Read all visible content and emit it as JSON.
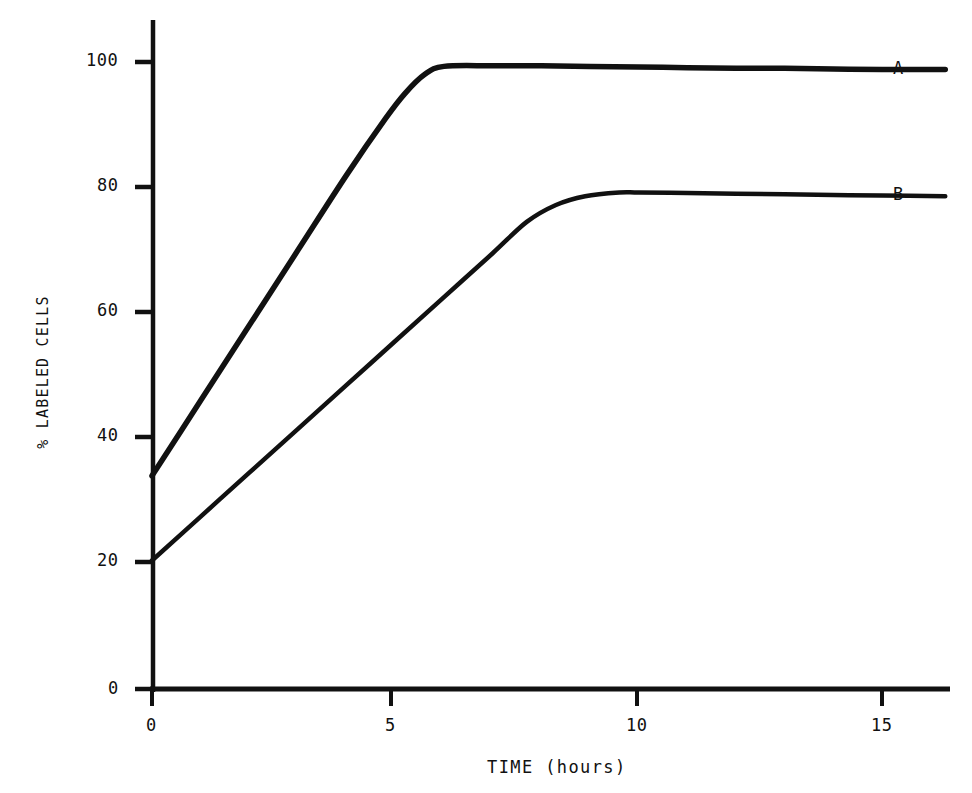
{
  "chart_data": {
    "type": "line",
    "title": "",
    "subtitle": "",
    "xlabel": "TIME (hours)",
    "ylabel": "% LABELED CELLS",
    "xlim": [
      0,
      16.3
    ],
    "ylim": [
      0,
      110
    ],
    "xticks": [
      0,
      5,
      10,
      15
    ],
    "xtick_labels": [
      "0",
      "5",
      "10",
      "15"
    ],
    "yticks": [
      0,
      20,
      40,
      60,
      80,
      100
    ],
    "ytick_labels": [
      "0",
      "20",
      "40",
      "60",
      "80",
      "100"
    ],
    "grid": false,
    "legend": "inline-right-end-labels",
    "line_color": "#111111",
    "background_color": "#ffffff",
    "series": [
      {
        "name": "A",
        "label": "A",
        "end_label": "A",
        "x": [
          0,
          1,
          2,
          3,
          4,
          4.8,
          5.2,
          5.6,
          6.0,
          7,
          8,
          9,
          10,
          11,
          12,
          13,
          14,
          15,
          16.3
        ],
        "values": [
          34,
          46,
          58,
          70,
          82,
          91,
          95,
          98,
          99.3,
          99.4,
          99.4,
          99.3,
          99.2,
          99.1,
          99.0,
          99.0,
          98.9,
          98.8,
          98.8
        ]
      },
      {
        "name": "B",
        "label": "B",
        "end_label": "B",
        "x": [
          0,
          1,
          2,
          3,
          4,
          5,
          6,
          7,
          7.7,
          8.3,
          8.9,
          9.6,
          10,
          11,
          12,
          13,
          14,
          15,
          16.3
        ],
        "values": [
          20.5,
          27.5,
          34.5,
          41.5,
          48.5,
          55.5,
          62.5,
          69.5,
          74.5,
          77.2,
          78.6,
          79.2,
          79.2,
          79.1,
          79.0,
          78.9,
          78.8,
          78.7,
          78.6
        ]
      }
    ],
    "annotations": [
      {
        "name": "series-a-end-label",
        "text": "A",
        "x": 16.6,
        "y": 99
      },
      {
        "name": "series-b-end-label",
        "text": "B",
        "x": 16.6,
        "y": 79
      }
    ]
  },
  "axes": {
    "x_axis_name": "time-axis",
    "y_axis_name": "percent-labeled-cells-axis"
  }
}
